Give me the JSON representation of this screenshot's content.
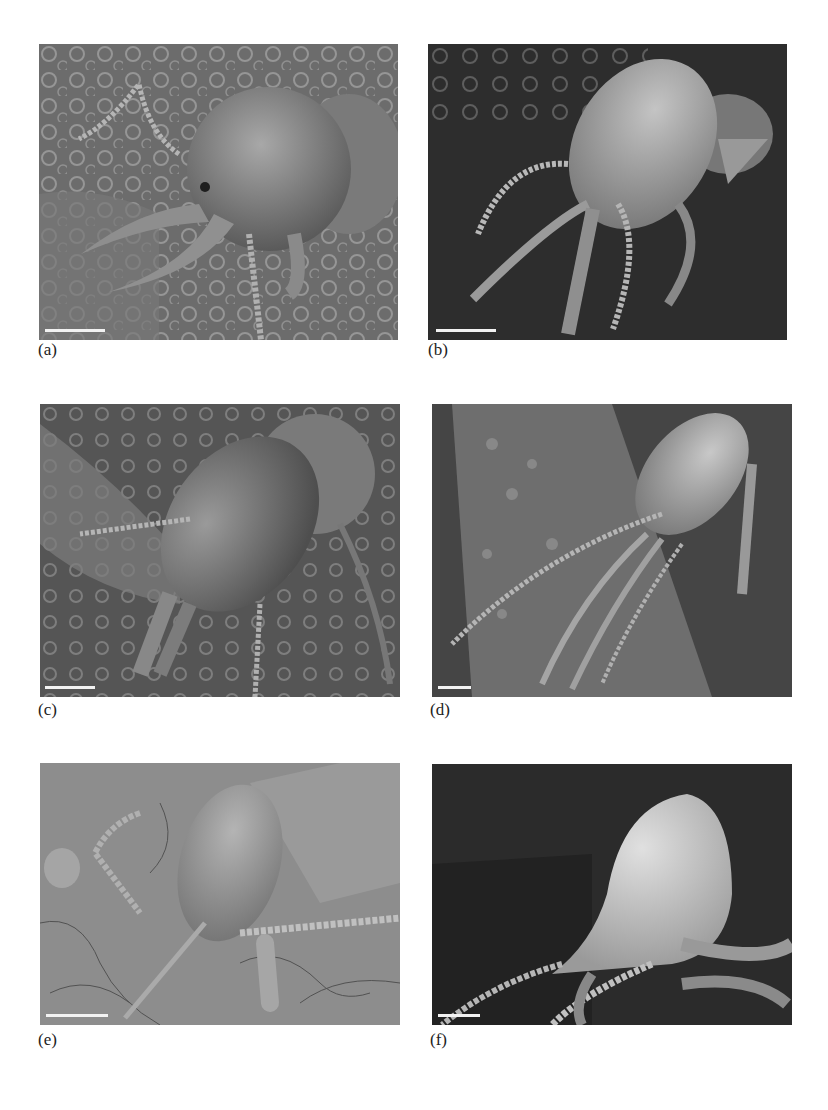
{
  "figure": {
    "panels": [
      {
        "id": "a",
        "label": "(a)",
        "description": "SEM micrograph of termite soldier head with long curved mandibles on pitted substrate",
        "background": "#6f6f6f",
        "scalebar_width_px": 60
      },
      {
        "id": "b",
        "label": "(b)",
        "description": "SEM micrograph of termite soldier with elongated head and thin mandibles on dark background",
        "background": "#2e2e2e",
        "scalebar_width_px": 60
      },
      {
        "id": "c",
        "label": "(c)",
        "description": "SEM micrograph of termite soldier head with short stout mandibles",
        "background": "#5a5a5a",
        "scalebar_width_px": 50
      },
      {
        "id": "d",
        "label": "(d)",
        "description": "SEM micrograph of termite soldier on plant stem with long slender mandibles",
        "background": "#4a4a4a",
        "scalebar_width_px": 33
      },
      {
        "id": "e",
        "label": "(e)",
        "description": "SEM micrograph of nasute-like termite soldier with snout on cracked surface",
        "background": "#8c8c8c",
        "scalebar_width_px": 62
      },
      {
        "id": "f",
        "label": "(f)",
        "description": "SEM micrograph of nasute termite soldier with pear-shaped head and frontal projection",
        "background": "#2a2a2a",
        "scalebar_width_px": 42
      }
    ]
  }
}
